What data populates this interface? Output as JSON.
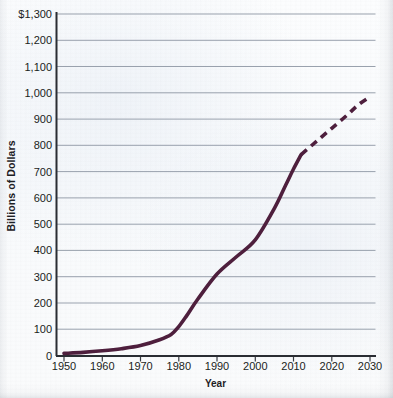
{
  "chart_data": {
    "type": "line",
    "title": "",
    "xlabel": "Year",
    "ylabel": "Billions of Dollars",
    "xlim": [
      1950,
      2030
    ],
    "ylim": [
      0,
      1300
    ],
    "grid": true,
    "grid_axis": "y",
    "legend": false,
    "series_color": "#4e1f3d",
    "x_tick_labels": [
      "1950",
      "1960",
      "1970",
      "1980",
      "1990",
      "2000",
      "2010",
      "2020",
      "2030"
    ],
    "x_tick_values": [
      1950,
      1960,
      1970,
      1980,
      1990,
      2000,
      2010,
      2020,
      2030
    ],
    "y_tick_labels": [
      "0",
      "100",
      "200",
      "300",
      "400",
      "500",
      "600",
      "700",
      "800",
      "900",
      "1,000",
      "1,100",
      "1,200",
      "$1,300"
    ],
    "y_tick_values": [
      0,
      100,
      200,
      300,
      400,
      500,
      600,
      700,
      800,
      900,
      1000,
      1100,
      1200,
      1300
    ],
    "series": [
      {
        "name": "Actual",
        "style": "solid",
        "x": [
          1950,
          1955,
          1960,
          1965,
          1970,
          1975,
          1978,
          1980,
          1982,
          1985,
          1990,
          1995,
          2000,
          2005,
          2008,
          2010,
          2012
        ],
        "values": [
          8,
          12,
          18,
          26,
          38,
          60,
          80,
          110,
          150,
          215,
          310,
          375,
          440,
          560,
          650,
          710,
          765
        ]
      },
      {
        "name": "Projected",
        "style": "dashed",
        "x": [
          2012,
          2016,
          2020,
          2024,
          2027,
          2030
        ],
        "values": [
          765,
          815,
          865,
          915,
          955,
          985
        ]
      }
    ]
  }
}
